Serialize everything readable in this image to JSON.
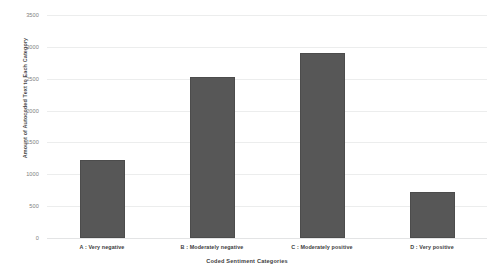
{
  "chart_data": {
    "type": "bar",
    "title": "",
    "xlabel": "Coded Sentiment Categories",
    "ylabel": "Amount of Autocoded Text to Each Category",
    "categories": [
      "A : Very negative",
      "B : Moderately negative",
      "C : Moderately positive",
      "D : Very positive"
    ],
    "values": [
      1220,
      2520,
      2900,
      720
    ],
    "ylim": [
      0,
      3500
    ],
    "ytick_values": [
      0,
      500,
      1000,
      1500,
      2000,
      2500,
      3000,
      3500
    ],
    "ytick_labels": [
      "0",
      "500",
      "1000",
      "1500",
      "2000",
      "2500",
      "3000",
      "3500"
    ],
    "grid": true,
    "legend": false,
    "bar_color": "#575757",
    "gridline_color": "#eceded",
    "background_color": "#ffffff"
  }
}
